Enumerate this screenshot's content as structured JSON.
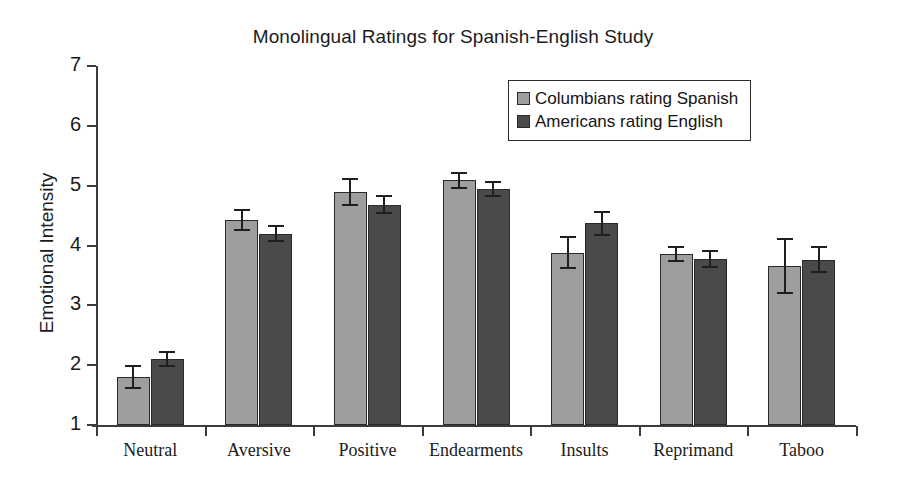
{
  "chart_data": {
    "type": "bar",
    "title": "Monolingual Ratings for Spanish-English Study",
    "xlabel": "",
    "ylabel": "Emotional Intensity",
    "ylim": [
      1,
      7
    ],
    "yticks": [
      1,
      2,
      3,
      4,
      5,
      6,
      7
    ],
    "grid": false,
    "legend_position": "upper right",
    "categories": [
      "Neutral",
      "Aversive",
      "Positive",
      "Endearments",
      "Insults",
      "Reprimand",
      "Taboo"
    ],
    "series": [
      {
        "name": "Columbians rating Spanish",
        "color": "#9e9e9e",
        "values": [
          1.8,
          4.43,
          4.89,
          5.09,
          3.88,
          3.86,
          3.66
        ],
        "errors": [
          0.18,
          0.17,
          0.22,
          0.13,
          0.26,
          0.12,
          0.45
        ]
      },
      {
        "name": "Americans rating English",
        "color": "#4a4a4a",
        "values": [
          2.1,
          4.2,
          4.68,
          4.94,
          4.37,
          3.77,
          3.76
        ],
        "errors": [
          0.12,
          0.13,
          0.14,
          0.12,
          0.19,
          0.13,
          0.21
        ]
      }
    ]
  },
  "legend": {
    "items": [
      {
        "label": "Columbians rating Spanish",
        "swatch": "light"
      },
      {
        "label": "Americans rating English",
        "swatch": "dark"
      }
    ]
  }
}
